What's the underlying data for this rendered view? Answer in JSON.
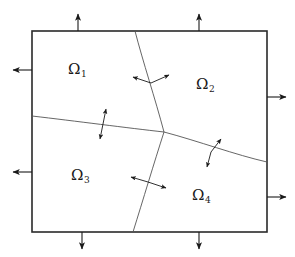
{
  "figure": {
    "background_color": "#ffffff",
    "boundary": {
      "name": "outer-domain-boundary",
      "color": "#2a2a2a",
      "stroke_width": 1.6,
      "left": 32,
      "top": 31,
      "right": 267,
      "bottom": 232
    },
    "interface_color": "#555555",
    "interface_stroke_width": 0.9,
    "arrow_color": "#1a1a1a",
    "junction": {
      "x": 164,
      "y": 132
    },
    "regions": [
      {
        "id": "omega-1",
        "symbol": "Ω",
        "subscript": "1",
        "x": 68,
        "y": 62
      },
      {
        "id": "omega-2",
        "symbol": "Ω",
        "subscript": "2",
        "x": 196,
        "y": 77
      },
      {
        "id": "omega-3",
        "symbol": "Ω",
        "subscript": "3",
        "x": 71,
        "y": 168
      },
      {
        "id": "omega-4",
        "symbol": "Ω",
        "subscript": "4",
        "x": 192,
        "y": 188
      }
    ],
    "interfaces": [
      {
        "id": "interface-upper-vertical",
        "path": "M 135 31 C 143 62, 155 98, 164 132"
      },
      {
        "id": "interface-lower-vertical",
        "path": "M 164 132 C 154 163, 143 200, 133 232"
      },
      {
        "id": "interface-left-horizontal",
        "path": "M 32 116 C 75 121, 128 128, 164 132"
      },
      {
        "id": "interface-right-horizontal",
        "path": "M 164 132 C 198 141, 236 155, 267 162"
      }
    ],
    "normal_arrows": [
      {
        "id": "normal-upper-left",
        "x1": 151,
        "y1": 83,
        "x2": 133,
        "y2": 77
      },
      {
        "id": "normal-upper-right",
        "x1": 151,
        "y1": 83,
        "x2": 169,
        "y2": 75
      },
      {
        "id": "normal-left-up",
        "x1": 103,
        "y1": 124,
        "x2": 106,
        "y2": 109
      },
      {
        "id": "normal-left-down",
        "x1": 103,
        "y1": 124,
        "x2": 100,
        "y2": 139
      },
      {
        "id": "normal-lower-left",
        "x1": 148,
        "y1": 182,
        "x2": 131,
        "y2": 177
      },
      {
        "id": "normal-lower-right",
        "x1": 148,
        "y1": 182,
        "x2": 166,
        "y2": 188
      },
      {
        "id": "normal-right-up",
        "x1": 211,
        "y1": 152,
        "x2": 221,
        "y2": 139
      },
      {
        "id": "normal-right-down",
        "x1": 211,
        "y1": 152,
        "x2": 207,
        "y2": 167
      }
    ],
    "boundary_arrows": [
      {
        "id": "boundary-arrow-top-left",
        "direction": "up",
        "x1": 78,
        "y1": 31,
        "x2": 78,
        "y2": 14
      },
      {
        "id": "boundary-arrow-top-right",
        "direction": "up",
        "x1": 199,
        "y1": 31,
        "x2": 199,
        "y2": 14
      },
      {
        "id": "boundary-arrow-left-upper",
        "direction": "left",
        "x1": 32,
        "y1": 70,
        "x2": 13,
        "y2": 70
      },
      {
        "id": "boundary-arrow-left-lower",
        "direction": "left",
        "x1": 32,
        "y1": 172,
        "x2": 13,
        "y2": 172
      },
      {
        "id": "boundary-arrow-right-upper",
        "direction": "right",
        "x1": 267,
        "y1": 97,
        "x2": 286,
        "y2": 97
      },
      {
        "id": "boundary-arrow-right-lower",
        "direction": "right",
        "x1": 267,
        "y1": 197,
        "x2": 286,
        "y2": 197
      },
      {
        "id": "boundary-arrow-bottom-left",
        "direction": "down",
        "x1": 82,
        "y1": 232,
        "x2": 82,
        "y2": 249
      },
      {
        "id": "boundary-arrow-bottom-right",
        "direction": "down",
        "x1": 199,
        "y1": 232,
        "x2": 199,
        "y2": 249
      }
    ]
  }
}
